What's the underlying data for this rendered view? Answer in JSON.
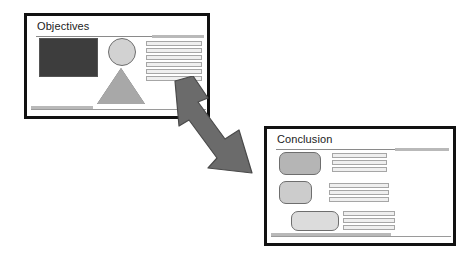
{
  "diagram": {
    "type": "slide-relationship-diagram",
    "background_color": "#ffffff"
  },
  "slides": [
    {
      "id": "objectives",
      "title": "Objectives",
      "position": {
        "x": 24,
        "y": 13,
        "width": 186,
        "height": 106
      },
      "border_color": "#111111",
      "background_color": "#ffffff",
      "shapes": [
        {
          "name": "dark-rectangle",
          "type": "rectangle",
          "fill": "#3d3d3d",
          "stroke": "#555555"
        },
        {
          "name": "light-circle",
          "type": "circle",
          "fill": "#d2d2d2",
          "stroke": "#6e6e6e"
        },
        {
          "name": "gray-triangle",
          "type": "triangle",
          "fill": "#a8a8a8",
          "stroke": "#5c5c5c"
        }
      ],
      "text_blocks": [
        {
          "name": "body-lines",
          "line_count": 6,
          "fill": "#efefef",
          "stroke": "#a6a6a6"
        }
      ]
    },
    {
      "id": "conclusion",
      "title": "Conclusion",
      "position": {
        "x": 264,
        "y": 126,
        "width": 192,
        "height": 120
      },
      "border_color": "#111111",
      "background_color": "#ffffff",
      "shapes": [
        {
          "name": "rounded-rect-1",
          "type": "rounded-rectangle",
          "fill": "#b5b5b5",
          "stroke": "#6e6e6e"
        },
        {
          "name": "rounded-rect-2",
          "type": "rounded-rectangle",
          "fill": "#cccccc",
          "stroke": "#6e6e6e"
        },
        {
          "name": "rounded-rect-3",
          "type": "rounded-rectangle",
          "fill": "#dcdcdc",
          "stroke": "#6e6e6e"
        }
      ],
      "text_blocks": [
        {
          "name": "body-lines-1",
          "line_count": 3,
          "fill": "#efefef",
          "stroke": "#a6a6a6"
        },
        {
          "name": "body-lines-2",
          "line_count": 3,
          "fill": "#efefef",
          "stroke": "#a6a6a6"
        },
        {
          "name": "body-lines-3",
          "line_count": 3,
          "fill": "#efefef",
          "stroke": "#a6a6a6"
        }
      ]
    }
  ],
  "connector": {
    "name": "double-headed-arrow",
    "direction": "bidirectional",
    "orientation": "diagonal-up-left-to-down-right",
    "fill": "#6b6b6b",
    "stroke": "#4a4a4a",
    "points_to": [
      "objectives",
      "conclusion"
    ]
  },
  "decorations": {
    "title_rule_color": "#8a8a8a",
    "title_accent_color": "#b9b9b9",
    "footer_rule_color": "#9a9a9a",
    "footer_accent_color": "#b9b9b9"
  }
}
